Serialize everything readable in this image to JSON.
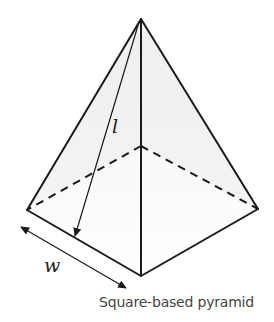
{
  "diagram": {
    "title": "Square-based pyramid",
    "labels": {
      "slant_height": "l",
      "base_width": "w"
    },
    "vertices": {
      "apex": [
        141,
        19
      ],
      "left": [
        27,
        210
      ],
      "right": [
        258,
        209
      ],
      "front": [
        141,
        276
      ],
      "back": [
        141,
        146
      ]
    },
    "colors": {
      "edge": "#1a1a1a",
      "face_shade": "#efefef",
      "caption": "#444444"
    }
  }
}
